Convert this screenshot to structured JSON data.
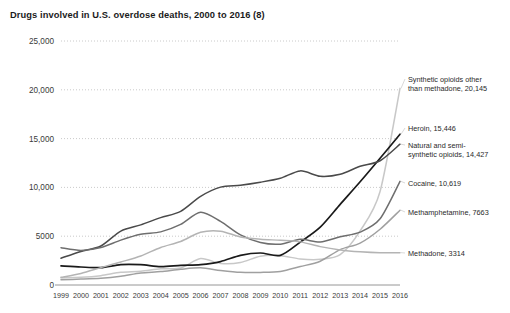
{
  "chart_data": {
    "type": "line",
    "title": "Drugs involved in U.S. overdose deaths, 2000 to 2016 (8)",
    "xlabel": "",
    "ylabel": "",
    "xlim": [
      1999,
      2016
    ],
    "ylim": [
      0,
      25000
    ],
    "grid": true,
    "legend_position": "right-inline-labels",
    "x": [
      1999,
      2000,
      2001,
      2002,
      2003,
      2004,
      2005,
      2006,
      2007,
      2008,
      2009,
      2010,
      2011,
      2012,
      2013,
      2014,
      2015,
      2016
    ],
    "xtick_labels": [
      "1999",
      "2000",
      "2001",
      "2002",
      "2003",
      "2004",
      "2005",
      "2006",
      "2007",
      "2008",
      "2009",
      "2010",
      "2011",
      "2012",
      "2013",
      "2014",
      "2015",
      "2016"
    ],
    "ytick_labels": [
      "0",
      "5000",
      "10,000",
      "15,000",
      "20,000",
      "25,000"
    ],
    "ytick_values": [
      0,
      5000,
      10000,
      15000,
      20000,
      25000
    ],
    "series": [
      {
        "name": "Synthetic opioids other than methadone",
        "label": "Synthetic opioids other than methadone, 20,145",
        "label_line1": "Synthetic opioids other",
        "label_line2": "than methadone, 20,145",
        "final_value": 20145,
        "color": "#c8c8c8",
        "width": 1.5,
        "values": [
          730,
          782,
          957,
          1295,
          1400,
          1664,
          1742,
          2707,
          2213,
          2306,
          2946,
          3007,
          2666,
          2628,
          3105,
          5544,
          9580,
          20145
        ]
      },
      {
        "name": "Heroin",
        "label": "Heroin, 15,446",
        "label_line1": "Heroin, 15,446",
        "label_line2": "",
        "final_value": 15446,
        "color": "#1a1a1a",
        "width": 1.7,
        "values": [
          1960,
          1842,
          1779,
          2089,
          2080,
          1878,
          2009,
          2088,
          2399,
          3041,
          3278,
          3036,
          4397,
          5925,
          8257,
          10574,
          12989,
          15446
        ]
      },
      {
        "name": "Natural and semi-synthetic opioids",
        "label": "Natural and semi-synthetic opioids, 14,427",
        "label_line1": "Natural and semi-",
        "label_line2": "synthetic opioids, 14,427",
        "final_value": 14427,
        "color": "#4a4a4a",
        "width": 1.5,
        "values": [
          2749,
          3442,
          3994,
          5528,
          6160,
          6904,
          7551,
          9085,
          10030,
          10228,
          10532,
          10943,
          11693,
          11140,
          11346,
          12159,
          12727,
          14427
        ]
      },
      {
        "name": "Cocaine",
        "label": "Cocaine, 10,619",
        "label_line1": "Cocaine, 10,619",
        "label_line2": "",
        "final_value": 10619,
        "color": "#6e6e6e",
        "width": 1.5,
        "values": [
          3822,
          3544,
          3833,
          4599,
          5196,
          5443,
          6208,
          7448,
          6512,
          5129,
          4350,
          4183,
          4681,
          4404,
          4944,
          5415,
          6784,
          10619
        ]
      },
      {
        "name": "Methamphetamine",
        "label": "Methamphetamine, 7663",
        "label_line1": "Methamphetamine, 7663",
        "label_line2": "",
        "final_value": 7663,
        "color": "#a0a0a0",
        "width": 1.5,
        "values": [
          547,
          602,
          690,
          903,
          1237,
          1371,
          1608,
          1756,
          1494,
          1302,
          1291,
          1388,
          1887,
          2440,
          3627,
          4298,
          5716,
          7663
        ]
      },
      {
        "name": "Methadone",
        "label": "Methadone, 3314",
        "label_line1": "Methadone, 3314",
        "label_line2": "",
        "final_value": 3314,
        "color": "#b4b4b4",
        "width": 1.5,
        "values": [
          784,
          1183,
          1779,
          2360,
          2972,
          3849,
          4462,
          5406,
          5518,
          4924,
          4694,
          4577,
          4418,
          3932,
          3591,
          3400,
          3301,
          3314
        ]
      }
    ]
  }
}
